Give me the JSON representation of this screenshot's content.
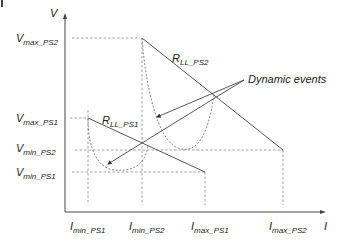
{
  "diagram": {
    "title": "",
    "corner_mark": "|",
    "axes": {
      "y_label": "V",
      "x_label": "I"
    },
    "y_ticks": [
      {
        "main": "V",
        "sub": "max_PS2"
      },
      {
        "main": "V",
        "sub": "max_PS1"
      },
      {
        "main": "V",
        "sub": "min_PS2"
      },
      {
        "main": "V",
        "sub": "min_PS1"
      }
    ],
    "x_ticks": [
      {
        "main": "I",
        "sub": "min_PS1"
      },
      {
        "main": "I",
        "sub": "min_PS2"
      },
      {
        "main": "I",
        "sub": "max_PS1"
      },
      {
        "main": "I",
        "sub": "max_PS2"
      }
    ],
    "load_lines": [
      {
        "main": "R",
        "sub": "LL_PS2"
      },
      {
        "main": "R",
        "sub": "LL_PS1"
      }
    ],
    "annotation": "Dynamic events",
    "colors": {
      "line": "#555555",
      "dashed": "#8a8a8a",
      "text": "#222222"
    }
  }
}
